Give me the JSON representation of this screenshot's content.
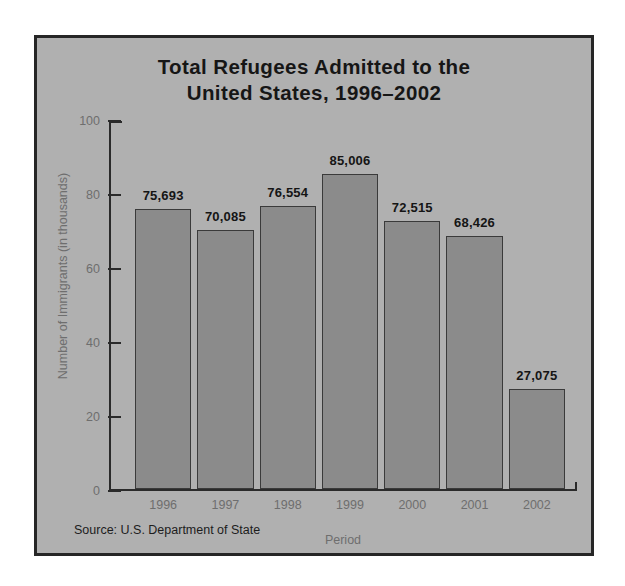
{
  "chart_data": {
    "type": "bar",
    "title": "Total Refugees Admitted to the\nUnited States, 1996–2002",
    "xlabel": "Period",
    "ylabel": "Number of Immigrants (in thousands)",
    "categories": [
      "1996",
      "1997",
      "1998",
      "1999",
      "2000",
      "2001",
      "2002"
    ],
    "values": [
      75.693,
      70.085,
      76.554,
      85.006,
      72.515,
      68.426,
      27.075
    ],
    "value_labels": [
      "75,693",
      "70,085",
      "76,554",
      "85,006",
      "72,515",
      "68,426",
      "27,075"
    ],
    "ylim": [
      0,
      100
    ],
    "yticks": [
      0,
      20,
      40,
      60,
      80,
      100
    ],
    "ytick_labels": [
      "0",
      "20",
      "40",
      "60",
      "80",
      "100"
    ],
    "grid": false,
    "legend": false,
    "source_note": "Source: U.S. Department of State",
    "colors": {
      "panel_background": "#b0b0b0",
      "panel_border": "#262626",
      "bar_fill": "#8b8b8b",
      "bar_edge": "#3a3a3a",
      "axis": "#2a2a2a",
      "tick_label": "#6e6e6e",
      "value_label": "#151515",
      "title": "#161616",
      "page_background": "#ffffff"
    }
  }
}
